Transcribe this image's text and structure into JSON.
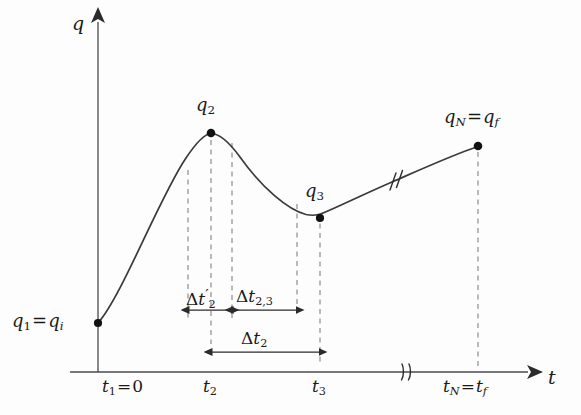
{
  "figure": {
    "type": "diagram",
    "background_color": "#fdfdfd",
    "ink_color": "#2b2b2b"
  },
  "axes": {
    "y_label": "q",
    "x_label": "t",
    "origin_x_px": 98,
    "origin_y_px": 372,
    "y_top_px": 15,
    "x_right_px": 535,
    "x_axis_break_px": 406,
    "grid": false
  },
  "points": [
    {
      "id": "q1",
      "label_q": "q1 = qi",
      "label_t": "t1 = 0",
      "x_px": 98,
      "y_px": 323,
      "dot": true,
      "dashed_drop": false
    },
    {
      "id": "q2",
      "label_q": "q2",
      "label_t": "t2",
      "x_px": 211,
      "y_px": 133,
      "dot": true,
      "dashed_drop": true
    },
    {
      "id": "q3",
      "label_q": "q3",
      "label_t": "t3",
      "x_px": 320,
      "y_px": 218,
      "dot": true,
      "dashed_drop": true
    },
    {
      "id": "qN",
      "label_q": "qN = qf",
      "label_t": "tN = tf",
      "x_px": 478,
      "y_px": 146,
      "dot": true,
      "dashed_drop": true
    }
  ],
  "helper_dashed_lines_px": [
    188,
    232,
    297
  ],
  "labels": {
    "q_axis": {
      "base": "q"
    },
    "t_axis": {
      "base": "t"
    },
    "q1": {
      "base": "q",
      "sub": "1",
      "eq": "=",
      "base2": "q",
      "sub2": "i"
    },
    "q2": {
      "base": "q",
      "sub": "2"
    },
    "q3": {
      "base": "q",
      "sub": "3"
    },
    "qN": {
      "base": "q",
      "sub": "N",
      "eq": "=",
      "base2": "q",
      "sub2": "f"
    },
    "t1": {
      "base": "t",
      "sub": "1",
      "eq": "=",
      "value": "0"
    },
    "t2": {
      "base": "t",
      "sub": "2"
    },
    "t3": {
      "base": "t",
      "sub": "3"
    },
    "tN": {
      "base": "t",
      "sub": "N",
      "eq": "=",
      "base2": "t",
      "sub2": "f"
    },
    "dt2_prime": {
      "delta": "Δ",
      "base": "t",
      "prime": "′",
      "sub": "2"
    },
    "dt23": {
      "delta": "Δ",
      "base": "t",
      "sub": "2,3"
    },
    "dt2": {
      "delta": "Δ",
      "base": "t",
      "sub": "2"
    }
  },
  "intervals": [
    {
      "id": "dt2_prime",
      "label": "Δt′2",
      "from_px": 188,
      "to_px": 232,
      "bar_y_px": 310,
      "arrows": "both"
    },
    {
      "id": "dt23",
      "label": "Δt2,3",
      "from_px": 232,
      "to_px": 297,
      "bar_y_px": 310,
      "arrows": "both"
    },
    {
      "id": "dt2",
      "label": "Δt2",
      "from_px": 211,
      "to_px": 320,
      "bar_y_px": 352,
      "arrows": "both"
    }
  ],
  "break_marks": [
    {
      "id": "curve-break",
      "x_px": 395,
      "y_px": 180,
      "on": "curve"
    },
    {
      "id": "axis-break",
      "x_px": 406,
      "y_px": 372,
      "on": "x-axis"
    }
  ]
}
